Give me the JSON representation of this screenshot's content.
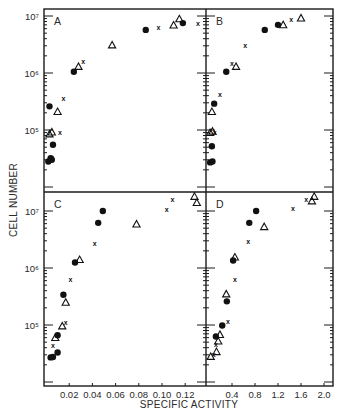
{
  "chart_data": {
    "type": "scatter",
    "xlabel": "SPECIFIC ACTIVITY",
    "ylabel": "CELL NUMBER",
    "marker_legend": {
      "circle": "filled circle",
      "triangle": "open triangle",
      "x": "x mark"
    },
    "panels": [
      {
        "label": "A",
        "position": "top-left",
        "yscale": "log",
        "ylim": [
          15000,
          12000000
        ],
        "yticks": [
          100000,
          1000000,
          10000000
        ],
        "ytick_labels": [
          "10^5",
          "10^6",
          "10^7"
        ],
        "xlim": [
          0,
          0.138
        ],
        "xticks": [],
        "points": [
          {
            "x": 0.086,
            "y": 5700000,
            "m": "circle"
          },
          {
            "x": 0.097,
            "y": 6400000,
            "m": "x"
          },
          {
            "x": 0.11,
            "y": 6900000,
            "m": "triangle"
          },
          {
            "x": 0.115,
            "y": 8900000,
            "m": "triangle"
          },
          {
            "x": 0.118,
            "y": 7500000,
            "m": "circle"
          },
          {
            "x": 0.131,
            "y": 7500000,
            "m": "x"
          },
          {
            "x": 0.057,
            "y": 3100000,
            "m": "triangle"
          },
          {
            "x": 0.032,
            "y": 1560000,
            "m": "x"
          },
          {
            "x": 0.028,
            "y": 1300000,
            "m": "triangle"
          },
          {
            "x": 0.024,
            "y": 1050000,
            "m": "circle"
          },
          {
            "x": 0.015,
            "y": 360000,
            "m": "x"
          },
          {
            "x": 0.003,
            "y": 260000,
            "m": "circle"
          },
          {
            "x": 0.01,
            "y": 210000,
            "m": "triangle"
          },
          {
            "x": 0.012,
            "y": 90000,
            "m": "x"
          },
          {
            "x": 0.003,
            "y": 85000,
            "m": "triangle"
          },
          {
            "x": 0.005,
            "y": 92000,
            "m": "triangle"
          },
          {
            "x": 0.006,
            "y": 55000,
            "m": "circle"
          },
          {
            "x": 0.005,
            "y": 33000,
            "m": "x"
          },
          {
            "x": 0.004,
            "y": 32000,
            "m": "circle"
          },
          {
            "x": 0.002,
            "y": 28000,
            "m": "circle"
          },
          {
            "x": 0.005,
            "y": 30000,
            "m": "circle"
          }
        ]
      },
      {
        "label": "B",
        "position": "top-right",
        "yscale": "log",
        "ylim": [
          15000,
          12000000
        ],
        "yticks": [
          100000,
          1000000,
          10000000
        ],
        "xlim": [
          0,
          2.15
        ],
        "xticks": [],
        "points": [
          {
            "x": 1.6,
            "y": 9200000,
            "m": "triangle"
          },
          {
            "x": 1.43,
            "y": 8700000,
            "m": "x"
          },
          {
            "x": 1.29,
            "y": 7000000,
            "m": "triangle"
          },
          {
            "x": 1.2,
            "y": 7000000,
            "m": "circle"
          },
          {
            "x": 0.97,
            "y": 5700000,
            "m": "circle"
          },
          {
            "x": 0.63,
            "y": 3000000,
            "m": "x"
          },
          {
            "x": 0.47,
            "y": 1300000,
            "m": "triangle"
          },
          {
            "x": 0.4,
            "y": 1450000,
            "m": "x"
          },
          {
            "x": 0.3,
            "y": 1050000,
            "m": "circle"
          },
          {
            "x": 0.19,
            "y": 420000,
            "m": "x"
          },
          {
            "x": 0.09,
            "y": 290000,
            "m": "circle"
          },
          {
            "x": 0.05,
            "y": 210000,
            "m": "triangle"
          },
          {
            "x": 0.02,
            "y": 90000,
            "m": "triangle"
          },
          {
            "x": 0.06,
            "y": 95000,
            "m": "triangle"
          },
          {
            "x": 0.1,
            "y": 92000,
            "m": "x"
          },
          {
            "x": 0.05,
            "y": 52000,
            "m": "circle"
          },
          {
            "x": 0.02,
            "y": 27000,
            "m": "circle"
          },
          {
            "x": 0.06,
            "y": 28000,
            "m": "circle"
          }
        ]
      },
      {
        "label": "C",
        "position": "bottom-left",
        "yscale": "log",
        "ylim": [
          15000,
          22000000
        ],
        "yticks": [
          100000,
          1000000,
          10000000
        ],
        "ytick_labels": [
          "10^5",
          "10^6",
          "10^7"
        ],
        "xlim": [
          0,
          0.138
        ],
        "xticks": [
          0.02,
          0.04,
          0.06,
          0.08,
          0.1,
          0.12
        ],
        "xtick_labels": [
          "0.02",
          "0.04",
          "0.06",
          "0.08",
          "0.10",
          "0.12"
        ],
        "points": [
          {
            "x": 0.049,
            "y": 10000000,
            "m": "circle"
          },
          {
            "x": 0.045,
            "y": 6200000,
            "m": "circle"
          },
          {
            "x": 0.042,
            "y": 2700000,
            "m": "x"
          },
          {
            "x": 0.078,
            "y": 5900000,
            "m": "triangle"
          },
          {
            "x": 0.104,
            "y": 10800000,
            "m": "x"
          },
          {
            "x": 0.109,
            "y": 15600000,
            "m": "x"
          },
          {
            "x": 0.128,
            "y": 18000000,
            "m": "triangle"
          },
          {
            "x": 0.13,
            "y": 14000000,
            "m": "triangle"
          },
          {
            "x": 0.029,
            "y": 1400000,
            "m": "triangle"
          },
          {
            "x": 0.025,
            "y": 1250000,
            "m": "circle"
          },
          {
            "x": 0.021,
            "y": 620000,
            "m": "x"
          },
          {
            "x": 0.015,
            "y": 340000,
            "m": "circle"
          },
          {
            "x": 0.017,
            "y": 250000,
            "m": "triangle"
          },
          {
            "x": 0.017,
            "y": 110000,
            "m": "x"
          },
          {
            "x": 0.014,
            "y": 96000,
            "m": "triangle"
          },
          {
            "x": 0.01,
            "y": 66000,
            "m": "circle"
          },
          {
            "x": 0.008,
            "y": 60000,
            "m": "triangle"
          },
          {
            "x": 0.006,
            "y": 44000,
            "m": "x"
          },
          {
            "x": 0.01,
            "y": 33000,
            "m": "circle"
          },
          {
            "x": 0.004,
            "y": 27000,
            "m": "circle"
          },
          {
            "x": 0.006,
            "y": 27500,
            "m": "circle"
          }
        ]
      },
      {
        "label": "D",
        "position": "bottom-right",
        "yscale": "log",
        "ylim": [
          15000,
          22000000
        ],
        "yticks": [
          100000,
          1000000,
          10000000
        ],
        "xlim": [
          0,
          2.15
        ],
        "xticks": [
          0.4,
          0.8,
          1.2,
          1.6,
          2.0
        ],
        "xtick_labels": [
          "0.4",
          "0.8",
          "1.2",
          "1.6",
          "2.0"
        ],
        "points": [
          {
            "x": 1.83,
            "y": 18000000,
            "m": "triangle"
          },
          {
            "x": 1.79,
            "y": 15000000,
            "m": "triangle"
          },
          {
            "x": 1.69,
            "y": 16000000,
            "m": "x"
          },
          {
            "x": 1.46,
            "y": 11000000,
            "m": "x"
          },
          {
            "x": 0.82,
            "y": 10000000,
            "m": "circle"
          },
          {
            "x": 0.7,
            "y": 6200000,
            "m": "circle"
          },
          {
            "x": 0.96,
            "y": 5300000,
            "m": "triangle"
          },
          {
            "x": 0.68,
            "y": 2900000,
            "m": "x"
          },
          {
            "x": 0.45,
            "y": 1550000,
            "m": "triangle"
          },
          {
            "x": 0.42,
            "y": 1350000,
            "m": "circle"
          },
          {
            "x": 0.45,
            "y": 640000,
            "m": "x"
          },
          {
            "x": 0.3,
            "y": 350000,
            "m": "triangle"
          },
          {
            "x": 0.31,
            "y": 260000,
            "m": "circle"
          },
          {
            "x": 0.33,
            "y": 115000,
            "m": "x"
          },
          {
            "x": 0.23,
            "y": 98000,
            "m": "circle"
          },
          {
            "x": 0.19,
            "y": 68000,
            "m": "triangle"
          },
          {
            "x": 0.12,
            "y": 63000,
            "m": "circle"
          },
          {
            "x": 0.16,
            "y": 52000,
            "m": "triangle"
          },
          {
            "x": 0.12,
            "y": 45000,
            "m": "x"
          },
          {
            "x": 0.13,
            "y": 34000,
            "m": "triangle"
          },
          {
            "x": 0.03,
            "y": 28000,
            "m": "triangle"
          },
          {
            "x": 0.08,
            "y": 30000,
            "m": "x"
          }
        ]
      }
    ],
    "grid": false,
    "legend": "none"
  }
}
